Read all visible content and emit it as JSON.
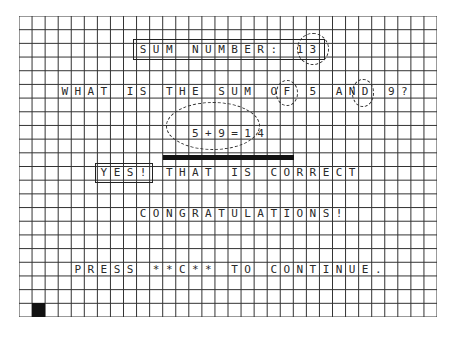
{
  "grid": {
    "columns": 32,
    "rows": 22,
    "line_color": "#333333",
    "background": "#ffffff"
  },
  "screen": {
    "title_line": {
      "label": "SUM NUMBER:",
      "number": "13",
      "row": 2,
      "col": 9
    },
    "question_line": {
      "parts": [
        "WHAT IS THE SUM OF ",
        "5",
        " AND ",
        "9",
        "?"
      ],
      "text": "WHAT IS THE SUM OF 5 AND 9?",
      "row": 5,
      "col": 3,
      "addend_a": "5",
      "addend_b": "9"
    },
    "answer_line": {
      "text": "5+9=14",
      "row": 8,
      "col": 13
    },
    "feedback_line": {
      "badge": "YES!",
      "text": "THAT IS CORRECT",
      "row": 11,
      "col": 6
    },
    "congrats_line": {
      "text": "CONGRATULATIONS!",
      "row": 14,
      "col": 9
    },
    "prompt_line": {
      "text": "PRESS **C** TO CONTINUE.",
      "row": 18,
      "col": 4
    },
    "cursor": {
      "row": 21,
      "col": 1,
      "color": "#111111"
    }
  }
}
